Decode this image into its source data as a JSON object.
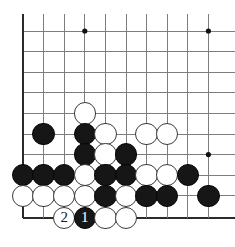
{
  "diagram": {
    "kind": "go-board-diagram",
    "title": "",
    "board_region": "bottom-left corner",
    "geometry": {
      "origin_x": 23,
      "origin_y": 31,
      "spacing": 20.6,
      "cols": 10,
      "rows": 10,
      "stone_radius": 11.2,
      "bottom_edge_y": 218,
      "left_edge_x": 23
    },
    "colors": {
      "background": "#ffffff",
      "grid_line": "#7d7d7d",
      "edge_line": "#2b2b2b",
      "black_stone": "#161616",
      "white_stone": "#ffffff",
      "white_stone_border": "#3a3a3a",
      "star_point": "#111111",
      "label_on_black": "#ffffff",
      "label_on_white": "#1a1a1a"
    },
    "star_points": [
      {
        "col": 3,
        "row": 0
      },
      {
        "col": 9,
        "row": 0
      },
      {
        "col": 9,
        "row": 6
      }
    ],
    "stones": [
      {
        "col": 3,
        "row": 4,
        "color": "white",
        "label": ""
      },
      {
        "col": 1,
        "row": 5,
        "color": "black",
        "label": ""
      },
      {
        "col": 3,
        "row": 5,
        "color": "black",
        "label": ""
      },
      {
        "col": 4,
        "row": 5,
        "color": "white",
        "label": ""
      },
      {
        "col": 6,
        "row": 5,
        "color": "white",
        "label": ""
      },
      {
        "col": 7,
        "row": 5,
        "color": "white",
        "label": ""
      },
      {
        "col": 3,
        "row": 6,
        "color": "black",
        "label": ""
      },
      {
        "col": 4,
        "row": 6,
        "color": "white",
        "label": ""
      },
      {
        "col": 5,
        "row": 6,
        "color": "black",
        "label": ""
      },
      {
        "col": 0,
        "row": 7,
        "color": "black",
        "label": ""
      },
      {
        "col": 1,
        "row": 7,
        "color": "black",
        "label": ""
      },
      {
        "col": 2,
        "row": 7,
        "color": "black",
        "label": ""
      },
      {
        "col": 3,
        "row": 7,
        "color": "white",
        "label": ""
      },
      {
        "col": 4,
        "row": 7,
        "color": "black",
        "label": ""
      },
      {
        "col": 5,
        "row": 7,
        "color": "black",
        "label": ""
      },
      {
        "col": 6,
        "row": 7,
        "color": "white",
        "label": ""
      },
      {
        "col": 7,
        "row": 7,
        "color": "white",
        "label": ""
      },
      {
        "col": 8,
        "row": 7,
        "color": "black",
        "label": ""
      },
      {
        "col": 0,
        "row": 8,
        "color": "white",
        "label": ""
      },
      {
        "col": 1,
        "row": 8,
        "color": "white",
        "label": ""
      },
      {
        "col": 2,
        "row": 8,
        "color": "white",
        "label": ""
      },
      {
        "col": 3,
        "row": 8,
        "color": "white",
        "label": ""
      },
      {
        "col": 4,
        "row": 8,
        "color": "black",
        "label": ""
      },
      {
        "col": 5,
        "row": 8,
        "color": "white",
        "label": ""
      },
      {
        "col": 6,
        "row": 8,
        "color": "black",
        "label": ""
      },
      {
        "col": 7,
        "row": 8,
        "color": "black",
        "label": ""
      },
      {
        "col": 9,
        "row": 8,
        "color": "black",
        "label": ""
      },
      {
        "col": 2,
        "row": 9,
        "color": "white",
        "label": "2"
      },
      {
        "col": 3,
        "row": 9,
        "color": "black",
        "label": "1"
      },
      {
        "col": 4,
        "row": 9,
        "color": "white",
        "label": ""
      },
      {
        "col": 5,
        "row": 9,
        "color": "white",
        "label": ""
      }
    ],
    "move_numbers": [
      {
        "number": "1",
        "color": "black",
        "col": 3,
        "row": 9
      },
      {
        "number": "2",
        "color": "white",
        "col": 2,
        "row": 9
      }
    ]
  }
}
